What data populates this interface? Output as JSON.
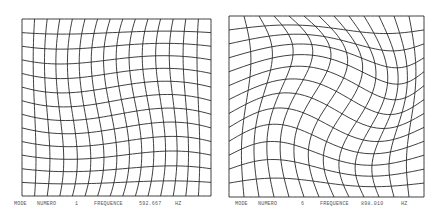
{
  "figure": {
    "background": "#ffffff",
    "line_color": "#2a2a2a",
    "panels": [
      {
        "id": "mode-1",
        "box": {
          "x": 22,
          "y": 19,
          "w": 189,
          "h": 177
        },
        "grid": {
          "cols": 15,
          "rows": 13
        },
        "deformation": "swirl",
        "amplitude": 0.09,
        "caption": {
          "mode_label": "MODE",
          "numero_label": "NUMERO",
          "mode_number": "1",
          "frequency_label": "FREQUENCE",
          "frequency_value": "592.667",
          "unit": "HZ"
        }
      },
      {
        "id": "mode-6",
        "box": {
          "x": 229,
          "y": 16,
          "w": 195,
          "h": 181
        },
        "grid": {
          "cols": 13,
          "rows": 13
        },
        "deformation": "shear-diagonal",
        "amplitude": 0.11,
        "caption": {
          "mode_label": "MODE",
          "numero_label": "NUMERO",
          "mode_number": "6",
          "frequency_label": "FREQUENCE",
          "frequency_value": "898.010",
          "unit": "HZ"
        }
      }
    ]
  }
}
